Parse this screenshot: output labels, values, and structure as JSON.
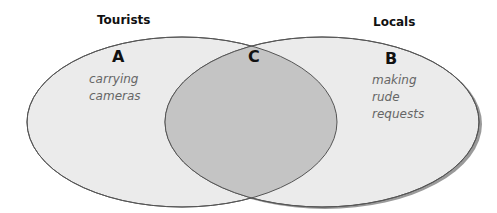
{
  "sets": {
    "left": {
      "title": "Tourists",
      "region_letter": "A",
      "description": [
        "carrying",
        "cameras"
      ]
    },
    "right": {
      "title": "Locals",
      "region_letter": "B",
      "description": [
        "making",
        "rude",
        "requests"
      ]
    },
    "intersection": {
      "region_letter": "C"
    }
  },
  "colors": {
    "background": "#ffffff",
    "set_fill": "#ebebeb",
    "intersection_fill": "#c4c4c4",
    "outline": "#555555",
    "shadow": "#9a9a9a",
    "description_text": "#666666"
  }
}
